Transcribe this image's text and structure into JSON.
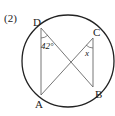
{
  "problem_number": "(2)",
  "points": {
    "A": {
      "label": "A",
      "x": 41,
      "y": 95
    },
    "B": {
      "label": "B",
      "x": 93,
      "y": 87
    },
    "C": {
      "label": "C",
      "x": 93,
      "y": 38
    },
    "D": {
      "label": "D",
      "x": 41,
      "y": 28
    }
  },
  "circle": {
    "cx": 68,
    "cy": 61,
    "r": 46
  },
  "angles": {
    "angle_D": {
      "label": "42°",
      "vertex": "D",
      "between": [
        "A",
        "B"
      ]
    },
    "angle_C": {
      "label": "x",
      "vertex": "C",
      "between": [
        "A",
        "B"
      ]
    }
  },
  "segments": [
    "DA",
    "DB",
    "CA",
    "CB"
  ],
  "colors": {
    "line": "#555555",
    "circle": "#222222",
    "text": "#222222"
  }
}
